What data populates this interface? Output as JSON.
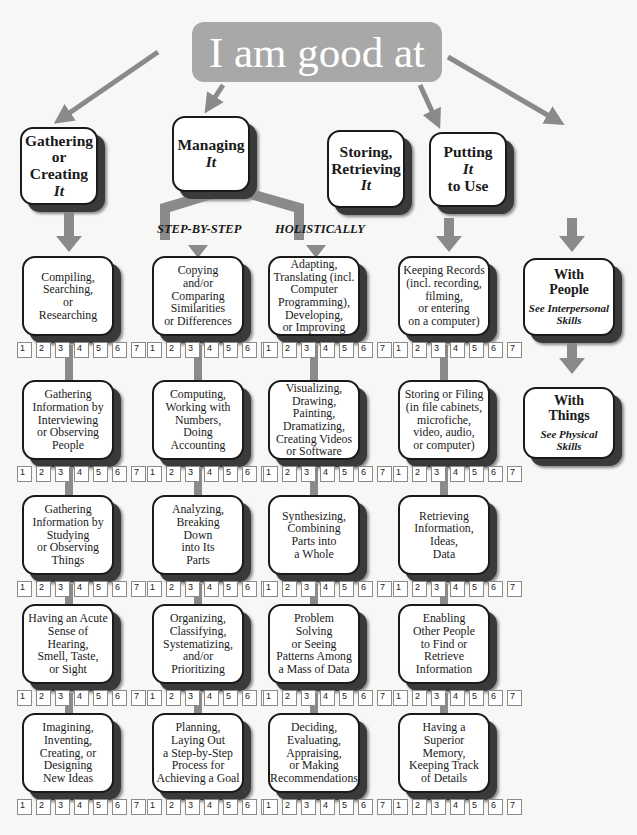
{
  "title": "I am good at",
  "colors": {
    "title_bg": "#a8a8a8",
    "connector": "#8a8a8a",
    "box_border": "#1a1a1a",
    "shadow": "#3a3a3a"
  },
  "categories": [
    {
      "id": "gathering",
      "lines": [
        "Gathering",
        "or",
        "Creating"
      ],
      "it": "It"
    },
    {
      "id": "managing",
      "lines": [
        "Managing"
      ],
      "it": "It"
    },
    {
      "id": "storing",
      "lines": [
        "Storing,",
        "Retrieving"
      ],
      "it": "It"
    },
    {
      "id": "putting",
      "lines": [
        "Putting"
      ],
      "it": "It",
      "after": "to Use"
    }
  ],
  "branch_labels": {
    "step_by_step": "STEP-BY-STEP",
    "holistically": "HOLISTICALLY"
  },
  "rating_scale": [
    "1",
    "2",
    "3",
    "4",
    "5",
    "6",
    "7"
  ],
  "columns": {
    "gathering": [
      [
        "Compiling,",
        "Searching,",
        "or",
        "Researching"
      ],
      [
        "Gathering",
        "Information by",
        "Interviewing",
        "or Observing",
        "People"
      ],
      [
        "Gathering",
        "Information by",
        "Studying",
        "or Observing",
        "Things"
      ],
      [
        "Having an Acute",
        "Sense of",
        "Hearing,",
        "Smell, Taste,",
        "or Sight"
      ],
      [
        "Imagining,",
        "Inventing,",
        "Creating, or",
        "Designing",
        "New Ideas"
      ]
    ],
    "step_by_step": [
      [
        "Copying",
        "and/or",
        "Comparing",
        "Similarities",
        "or Differences"
      ],
      [
        "Computing,",
        "Working with",
        "Numbers,",
        "Doing",
        "Accounting"
      ],
      [
        "Analyzing,",
        "Breaking",
        "Down",
        "into Its",
        "Parts"
      ],
      [
        "Organizing,",
        "Classifying,",
        "Systematizing,",
        "and/or",
        "Prioritizing"
      ],
      [
        "Planning,",
        "Laying Out",
        "a Step-by-Step",
        "Process for",
        "Achieving a Goal"
      ]
    ],
    "holistically": [
      [
        "Adapting,",
        "Translating (incl.",
        "Computer",
        "Programming),",
        "Developing,",
        "or Improving"
      ],
      [
        "Visualizing,",
        "Drawing,",
        "Painting,",
        "Dramatizing,",
        "Creating Videos",
        "or Software"
      ],
      [
        "Synthesizing,",
        "Combining",
        "Parts into",
        "a Whole"
      ],
      [
        "Problem",
        "Solving",
        "or Seeing",
        "Patterns Among",
        "a Mass of Data"
      ],
      [
        "Deciding,",
        "Evaluating,",
        "Appraising,",
        "or Making",
        "Recommendations"
      ]
    ],
    "storing": [
      [
        "Keeping Records",
        "(incl. recording,",
        "filming,",
        "or entering",
        "on a computer)"
      ],
      [
        "Storing or Filing",
        "(in file cabinets,",
        "microfiche,",
        "video, audio,",
        "or computer)"
      ],
      [
        "Retrieving",
        "Information,",
        "Ideas,",
        "Data"
      ],
      [
        "Enabling",
        "Other People",
        "to Find or",
        "Retrieve",
        "Information"
      ],
      [
        "Having a",
        "Superior",
        "Memory,",
        "Keeping Track",
        "of Details"
      ]
    ]
  },
  "putting_items": [
    {
      "title": [
        "With",
        "People"
      ],
      "see": [
        "See Interpersonal",
        "Skills"
      ]
    },
    {
      "title": [
        "With",
        "Things"
      ],
      "see": [
        "See Physical",
        "Skills"
      ]
    }
  ]
}
